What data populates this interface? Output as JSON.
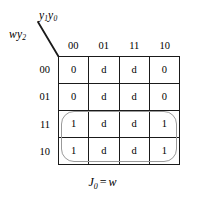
{
  "figure": {
    "kind": "karnaugh-map",
    "caption": {
      "function_name": "J",
      "function_subscript": "0",
      "operator": "=",
      "expression": "w",
      "full_text": "J0 = w"
    },
    "axes": {
      "column_variable": {
        "base": "y",
        "sub1": "1",
        "base2": "y",
        "sub2": "0",
        "full_text": "y1y0"
      },
      "row_variable": {
        "base": "w",
        "base2": "y",
        "sub2": "2",
        "full_text": "wy2"
      }
    },
    "column_headers": [
      "00",
      "01",
      "11",
      "10"
    ],
    "row_headers": [
      "00",
      "01",
      "11",
      "10"
    ],
    "rows": [
      {
        "header": "00",
        "cells": [
          "0",
          "d",
          "d",
          "0"
        ]
      },
      {
        "header": "01",
        "cells": [
          "0",
          "d",
          "d",
          "0"
        ]
      },
      {
        "header": "11",
        "cells": [
          "1",
          "d",
          "d",
          "1"
        ]
      },
      {
        "header": "10",
        "cells": [
          "1",
          "d",
          "d",
          "1"
        ]
      }
    ],
    "groups": [
      {
        "label": "group-w",
        "covers_rows": [
          "11",
          "10"
        ],
        "covers_columns": [
          "00",
          "01",
          "11",
          "10"
        ],
        "color": "#9a9a9a"
      }
    ],
    "colors": {
      "background": "#ffffff",
      "grid_line": "#1a1a1a",
      "text": "#000000",
      "group_outline": "#9a9a9a"
    }
  }
}
